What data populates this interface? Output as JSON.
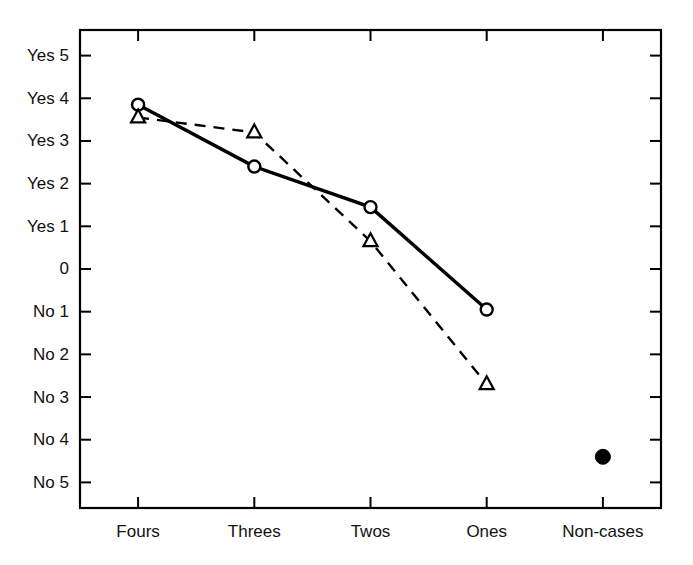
{
  "chart_data": {
    "type": "line",
    "title": "",
    "xlabel": "",
    "ylabel": "",
    "grid": false,
    "legend": "none",
    "categories": [
      "Fours",
      "Threes",
      "Twos",
      "Ones",
      "Non-cases"
    ],
    "y_tick_labels": [
      "Yes 5",
      "Yes 4",
      "Yes 3",
      "Yes 2",
      "Yes 1",
      "0",
      "No 1",
      "No 2",
      "No 3",
      "No 4",
      "No 5"
    ],
    "y_tick_values": [
      5,
      4,
      3,
      2,
      1,
      0,
      -1,
      -2,
      -3,
      -4,
      -5
    ],
    "ylim": [
      -5.6,
      5.6
    ],
    "series": [
      {
        "name": "solid-circle-series",
        "marker": "open-circle",
        "line_style": "solid",
        "color": "#000000",
        "x": [
          "Fours",
          "Threes",
          "Twos",
          "Ones"
        ],
        "values": [
          3.85,
          2.4,
          1.45,
          -0.95
        ]
      },
      {
        "name": "dashed-triangle-series",
        "marker": "open-triangle",
        "line_style": "dashed",
        "color": "#000000",
        "x": [
          "Fours",
          "Threes",
          "Twos",
          "Ones"
        ],
        "values": [
          3.55,
          3.2,
          0.65,
          -2.7
        ]
      },
      {
        "name": "non-cases-point",
        "marker": "filled-circle",
        "line_style": "none",
        "color": "#000000",
        "x": [
          "Non-cases"
        ],
        "values": [
          -4.4
        ]
      }
    ]
  },
  "axes": {
    "frame_color": "#000000",
    "tick_color": "#000000"
  }
}
